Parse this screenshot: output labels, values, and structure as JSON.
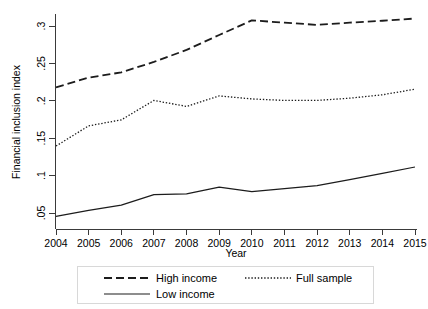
{
  "chart_data": {
    "type": "line",
    "title": "",
    "xlabel": "Year",
    "ylabel": "Financial inclusion index",
    "x": [
      2004,
      2005,
      2006,
      2007,
      2008,
      2009,
      2010,
      2011,
      2012,
      2013,
      2014,
      2015
    ],
    "categories": [
      "2004",
      "2005",
      "2006",
      "2007",
      "2008",
      "2009",
      "2010",
      "2011",
      "2012",
      "2013",
      "2014",
      "2015"
    ],
    "xlim": [
      2004,
      2015
    ],
    "ylim": [
      0.04,
      0.315
    ],
    "ytick_values": [
      0.05,
      0.1,
      0.15,
      0.2,
      0.25,
      0.3
    ],
    "ytick_labels": [
      ".05",
      ".1",
      ".15",
      ".2",
      ".25",
      ".3"
    ],
    "grid": false,
    "legend_position": "bottom",
    "series": [
      {
        "name": "High income",
        "style": "dashed",
        "color": "#1c1c1c",
        "values": [
          0.218,
          0.231,
          0.238,
          0.252,
          0.268,
          0.288,
          0.3075,
          0.3045,
          0.3015,
          0.3045,
          0.307,
          0.31
        ]
      },
      {
        "name": "Full sample",
        "style": "dotted",
        "color": "#1c1c1c",
        "values": [
          0.1395,
          0.1665,
          0.1745,
          0.2005,
          0.1925,
          0.2065,
          0.2025,
          0.2005,
          0.2005,
          0.2035,
          0.208,
          0.2155
        ]
      },
      {
        "name": "Low income",
        "style": "solid",
        "color": "#1c1c1c",
        "values": [
          0.0455,
          0.0535,
          0.0605,
          0.0745,
          0.0755,
          0.0845,
          0.0785,
          0.0825,
          0.0865,
          0.0945,
          0.103,
          0.1115
        ]
      }
    ]
  },
  "legend": {
    "entries": [
      {
        "label": "High income",
        "style": "dashed"
      },
      {
        "label": "Full sample",
        "style": "dotted"
      },
      {
        "label": "Low income",
        "style": "solid"
      }
    ]
  },
  "axes": {
    "x_title": "Year",
    "y_title": "Financial inclusion index"
  }
}
